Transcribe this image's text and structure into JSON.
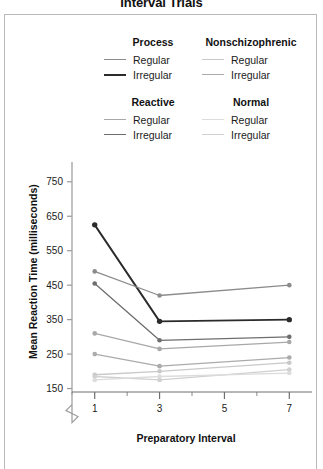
{
  "title": "Interval Trials",
  "legend": {
    "groups": [
      {
        "name": "Process",
        "items": [
          {
            "label": "Regular",
            "color": "#8c8c8c",
            "weight": "thin"
          },
          {
            "label": "Irregular",
            "color": "#2b2b2b",
            "weight": "thick"
          }
        ]
      },
      {
        "name": "Nonschizophrenic",
        "items": [
          {
            "label": "Regular",
            "color": "#c9c9c9",
            "weight": "thin"
          },
          {
            "label": "Irregular",
            "color": "#ababab",
            "weight": "thin"
          }
        ]
      },
      {
        "name": "Reactive",
        "items": [
          {
            "label": "Regular",
            "color": "#a8a8a8",
            "weight": "thin"
          },
          {
            "label": "Irregular",
            "color": "#6e6e6e",
            "weight": "thin"
          }
        ]
      },
      {
        "name": "Normal",
        "items": [
          {
            "label": "Regular",
            "color": "#dcdcdc",
            "weight": "thin"
          },
          {
            "label": "Irregular",
            "color": "#d0d0d0",
            "weight": "thin"
          }
        ]
      }
    ]
  },
  "chart_data": {
    "type": "line",
    "title": "Interval Trials",
    "xlabel": "Preparatory Interval",
    "ylabel": "Mean Reaction Time (milliseconds)",
    "x": [
      1,
      3,
      7
    ],
    "xticks": [
      1,
      3,
      5,
      7
    ],
    "xlim": [
      0.3,
      7.7
    ],
    "yticks": [
      150,
      250,
      350,
      450,
      550,
      650,
      750
    ],
    "ylim": [
      140,
      790
    ],
    "axis_break": true,
    "grid": false,
    "legend_position": "top",
    "series": [
      {
        "name": "Process Irregular",
        "group": "Process",
        "condition": "Irregular",
        "color": "#2b2b2b",
        "values": [
          625,
          345,
          350
        ]
      },
      {
        "name": "Process Regular",
        "group": "Process",
        "condition": "Regular",
        "color": "#8c8c8c",
        "values": [
          490,
          420,
          450
        ]
      },
      {
        "name": "Reactive Irregular",
        "group": "Reactive",
        "condition": "Irregular",
        "color": "#6e6e6e",
        "values": [
          455,
          290,
          300
        ]
      },
      {
        "name": "Reactive Regular",
        "group": "Reactive",
        "condition": "Regular",
        "color": "#a8a8a8",
        "values": [
          310,
          265,
          285
        ]
      },
      {
        "name": "Nonschizophrenic Irregular",
        "group": "Nonschizophrenic",
        "condition": "Irregular",
        "color": "#ababab",
        "values": [
          250,
          215,
          240
        ]
      },
      {
        "name": "Nonschizophrenic Regular",
        "group": "Nonschizophrenic",
        "condition": "Regular",
        "color": "#c9c9c9",
        "values": [
          190,
          200,
          225
        ]
      },
      {
        "name": "Normal Irregular",
        "group": "Normal",
        "condition": "Irregular",
        "color": "#d0d0d0",
        "values": [
          185,
          175,
          205
        ]
      },
      {
        "name": "Normal Regular",
        "group": "Normal",
        "condition": "Regular",
        "color": "#dcdcdc",
        "values": [
          175,
          185,
          195
        ]
      }
    ]
  }
}
